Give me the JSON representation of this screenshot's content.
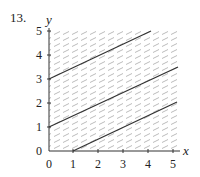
{
  "problem_number": "13.",
  "axes": {
    "x_label": "x",
    "y_label": "y",
    "x_ticks": [
      "0",
      "1",
      "2",
      "3",
      "4",
      "5"
    ],
    "y_ticks": [
      "0",
      "1",
      "2",
      "3",
      "4",
      "5"
    ]
  },
  "lines": [
    {
      "name": "top-line",
      "equation": "y = x/2 + 3",
      "from": [
        0,
        3
      ],
      "to": [
        4,
        5
      ]
    },
    {
      "name": "middle-line",
      "equation": "y = x/2 + 1",
      "from": [
        0,
        1
      ],
      "to": [
        5.2,
        3.6
      ]
    },
    {
      "name": "bottom-line",
      "equation": "y = x/2 - 1/2",
      "from": [
        1,
        0
      ],
      "to": [
        5.2,
        2.1
      ]
    }
  ],
  "hatching": "direction field short dashes, slope 1/2",
  "colors": {
    "line": "#333333",
    "hatch": "#aaaaaa",
    "axis": "#333333"
  }
}
